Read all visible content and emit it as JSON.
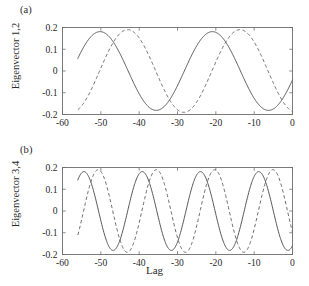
{
  "figure": {
    "xlabel": "Lag",
    "background": "#ffffff",
    "axis_color": "#6e6e6e",
    "solid_color": "#555555",
    "dashed_color": "#6a6a6a"
  },
  "panel_a": {
    "tag": "(a)",
    "ylabel": "Eigenvector 1,2",
    "xticks": [
      "-60",
      "-50",
      "-40",
      "-30",
      "-20",
      "-10",
      "0"
    ],
    "yticks": [
      "0.2",
      "0.1",
      "0",
      "-0.1",
      "-0.2"
    ]
  },
  "panel_b": {
    "tag": "(b)",
    "ylabel": "Eigenvector 3,4",
    "xticks": [
      "-60",
      "-50",
      "-40",
      "-30",
      "-20",
      "-10",
      "0"
    ],
    "yticks": [
      "0.2",
      "0.1",
      "0",
      "-0.1",
      "-0.2"
    ]
  },
  "chart_data": [
    {
      "type": "line",
      "panel": "(a)",
      "title": "",
      "xlabel": "Lag",
      "ylabel": "Eigenvector 1,2",
      "xlim": [
        -60,
        0
      ],
      "ylim": [
        -0.2,
        0.2
      ],
      "xticks": [
        -60,
        -50,
        -40,
        -30,
        -20,
        -10,
        0
      ],
      "yticks": [
        -0.2,
        -0.1,
        0,
        0.1,
        0.2
      ],
      "grid": false,
      "legend": null,
      "x_start": -56,
      "x_end": 0,
      "series": [
        {
          "name": "Eigenvector 1",
          "style": "solid",
          "amplitude": 0.181,
          "period": 29.3,
          "peak_lags": [
            -50.2,
            -20.9
          ],
          "trough_lags": [
            -35.5,
            -6.2
          ],
          "value_at_x_start": 0.079,
          "value_at_x_end": -0.086
        },
        {
          "name": "Eigenvector 2",
          "style": "dashed",
          "amplitude": 0.19,
          "period": 29.3,
          "peak_lags": [
            -43.0,
            -13.7
          ],
          "trough_lags": [
            -57.6,
            -28.4
          ],
          "value_at_x_start": -0.178,
          "value_at_x_end": 0.119
        }
      ]
    },
    {
      "type": "line",
      "panel": "(b)",
      "title": "",
      "xlabel": "Lag",
      "ylabel": "Eigenvector 3,4",
      "xlim": [
        -60,
        0
      ],
      "ylim": [
        -0.2,
        0.2
      ],
      "xticks": [
        -60,
        -50,
        -40,
        -30,
        -20,
        -10,
        0
      ],
      "yticks": [
        -0.2,
        -0.1,
        0,
        0.1,
        0.2
      ],
      "grid": false,
      "legend": null,
      "x_start": -56,
      "x_end": 0,
      "series": [
        {
          "name": "Eigenvector 3",
          "style": "solid",
          "amplitude": 0.181,
          "period": 15.2,
          "peak_lags": [
            -54.4,
            -39.2,
            -24.0,
            -8.8
          ],
          "trough_lags": [
            -46.8,
            -31.6,
            -16.4,
            -1.2
          ],
          "value_at_x_start": 0.156,
          "value_at_x_end": 0.15
        },
        {
          "name": "Eigenvector 4",
          "style": "dashed",
          "amplitude": 0.19,
          "period": 15.2,
          "peak_lags": [
            -50.7,
            -35.5,
            -20.3,
            -5.1
          ],
          "trough_lags": [
            -58.3,
            -43.1,
            -27.9,
            -12.7
          ],
          "value_at_x_start": -0.128,
          "value_at_x_end": -0.118
        }
      ]
    }
  ]
}
